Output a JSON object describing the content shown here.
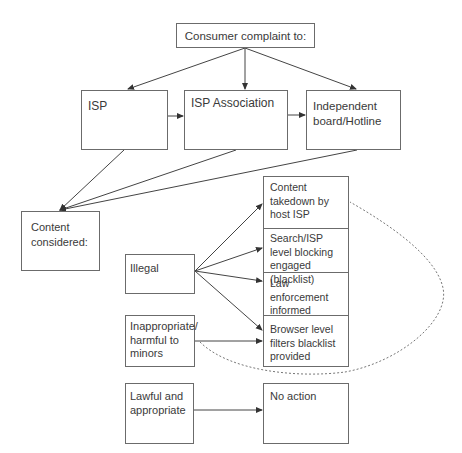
{
  "diagram": {
    "title": "Consumer complaint to:",
    "complaint_targets": [
      {
        "label": "ISP"
      },
      {
        "label": "ISP Association"
      },
      {
        "label": "Independent board/Hotline"
      }
    ],
    "content_considered": {
      "label": "Content considered:"
    },
    "categories": [
      {
        "label": "Illegal"
      },
      {
        "label": "Inappropriate/ harmful to minors"
      },
      {
        "label": "Lawful and appropriate"
      }
    ],
    "actions": [
      {
        "label": "Content takedown by host ISP"
      },
      {
        "label": "Search/ISP level blocking engaged (blacklist)"
      },
      {
        "label": "Law enforcement informed"
      },
      {
        "label": "Browser level filters blacklist provided"
      }
    ],
    "no_action": {
      "label": "No action"
    },
    "edges": [
      {
        "from": "Consumer complaint to:",
        "to": "ISP",
        "style": "arrow"
      },
      {
        "from": "Consumer complaint to:",
        "to": "ISP Association",
        "style": "arrow"
      },
      {
        "from": "Consumer complaint to:",
        "to": "Independent board/Hotline",
        "style": "arrow"
      },
      {
        "from": "ISP",
        "to": "ISP Association",
        "style": "arrow"
      },
      {
        "from": "ISP Association",
        "to": "Independent board/Hotline",
        "style": "arrow"
      },
      {
        "from": "ISP",
        "to": "Content considered:",
        "style": "arrow"
      },
      {
        "from": "ISP Association",
        "to": "Content considered:",
        "style": "arrow"
      },
      {
        "from": "Independent board/Hotline",
        "to": "Content considered:",
        "style": "arrow"
      },
      {
        "from": "Illegal",
        "to": "Content takedown by host ISP",
        "style": "arrow"
      },
      {
        "from": "Illegal",
        "to": "Search/ISP level blocking engaged (blacklist)",
        "style": "arrow"
      },
      {
        "from": "Illegal",
        "to": "Law enforcement informed",
        "style": "arrow"
      },
      {
        "from": "Illegal",
        "to": "Browser level filters blacklist provided",
        "style": "arrow"
      },
      {
        "from": "Inappropriate/ harmful to minors",
        "to": "Browser level filters blacklist provided",
        "style": "arrow"
      },
      {
        "from": "Lawful and appropriate",
        "to": "No action",
        "style": "arrow"
      },
      {
        "from": "Inappropriate/ harmful to minors",
        "to": "Content takedown by host ISP",
        "style": "dashed-curve"
      }
    ]
  }
}
